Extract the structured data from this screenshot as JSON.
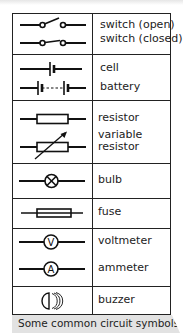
{
  "caption": "Some common circuit symbols.",
  "rows": [
    {
      "symbols": [
        "switch-open",
        "switch-closed"
      ],
      "labels": [
        "switch (open)",
        "switch (closed)"
      ]
    },
    {
      "symbols": [
        "cell",
        "battery"
      ],
      "labels": [
        "cell",
        "battery"
      ]
    },
    {
      "symbols": [
        "resistor",
        "variable-resistor"
      ],
      "labels": [
        "resistor",
        "variable",
        "resistor"
      ]
    },
    {
      "symbols": [
        "bulb"
      ],
      "labels": [
        "bulb"
      ]
    },
    {
      "symbols": [
        "fuse"
      ],
      "labels": [
        "fuse"
      ]
    },
    {
      "symbols": [
        "voltmeter",
        "ammeter"
      ],
      "labels": [
        "voltmeter",
        "ammeter"
      ]
    },
    {
      "symbols": [
        "buzzer"
      ],
      "labels": [
        "buzzer"
      ]
    }
  ],
  "meter_letters": {
    "voltmeter": "V",
    "ammeter": "A"
  }
}
